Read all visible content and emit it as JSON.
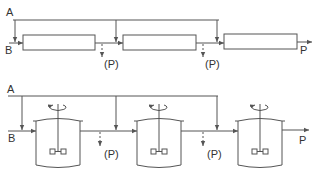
{
  "diagram": {
    "colors": {
      "line": "#555555",
      "text": "#333333",
      "background": "#ffffff"
    },
    "top": {
      "title": "Tubular reactors in series with split feed of A",
      "label_a": "A",
      "label_b": "B",
      "label_p": "P",
      "side_draws": [
        "(P)",
        "(P)"
      ],
      "units": [
        "reactor-1",
        "reactor-2",
        "reactor-3"
      ]
    },
    "bottom": {
      "title": "Stirred tank reactors in series with split feed of A",
      "label_a": "A",
      "label_b": "B",
      "label_p": "P",
      "side_draws": [
        "(P)",
        "(P)"
      ],
      "units": [
        "tank-1",
        "tank-2",
        "tank-3"
      ]
    }
  }
}
